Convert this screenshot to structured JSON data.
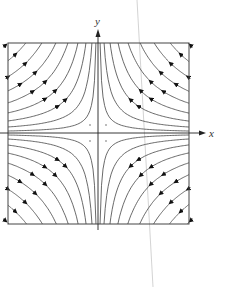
{
  "figure": {
    "axes": {
      "x_label": "x",
      "y_label": "y"
    },
    "system": {
      "description": "Hyperbolic trajectories xy = c around a saddle at the origin",
      "x_flow": "toward y-axis",
      "y_flow": "away from x-axis"
    },
    "levels": [
      0.02,
      0.06,
      0.12,
      0.2,
      0.3,
      0.42,
      0.56,
      0.72,
      0.9
    ],
    "colors": {
      "curve": "#444444",
      "frame": "#444444",
      "axis": "#222222",
      "arrow": "#111111",
      "guide": "#cccccc",
      "stray_line": "#c8c8c8"
    }
  }
}
